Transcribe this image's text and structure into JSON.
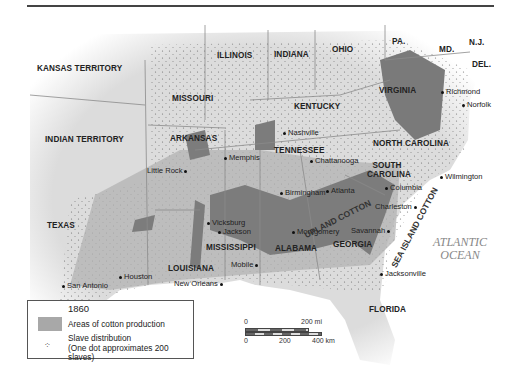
{
  "map": {
    "title_year": "1860",
    "colors": {
      "background": "#ffffff",
      "land": "#e4e4e4",
      "cotton": "#a9a9a9",
      "cotton_dense": "#7d7d7d",
      "ocean": "#ffffff",
      "border": "#8a8a8a"
    },
    "states": [
      {
        "name": "KANSAS TERRITORY"
      },
      {
        "name": "MISSOURI"
      },
      {
        "name": "ILLINOIS"
      },
      {
        "name": "INDIANA"
      },
      {
        "name": "OHIO"
      },
      {
        "name": "PA."
      },
      {
        "name": "MD."
      },
      {
        "name": "N.J."
      },
      {
        "name": "DEL."
      },
      {
        "name": "VIRGINIA"
      },
      {
        "name": "KENTUCKY"
      },
      {
        "name": "INDIAN TERRITORY"
      },
      {
        "name": "ARKANSAS"
      },
      {
        "name": "TENNESSEE"
      },
      {
        "name": "NORTH CAROLINA"
      },
      {
        "name": "SOUTH CAROLINA"
      },
      {
        "name": "TEXAS"
      },
      {
        "name": "MISSISSIPPI"
      },
      {
        "name": "ALABAMA"
      },
      {
        "name": "GEORGIA"
      },
      {
        "name": "LOUISIANA"
      },
      {
        "name": "FLORIDA"
      }
    ],
    "cities": [
      {
        "name": "Richmond"
      },
      {
        "name": "Norfolk"
      },
      {
        "name": "Nashville"
      },
      {
        "name": "Memphis"
      },
      {
        "name": "Chattanooga"
      },
      {
        "name": "Little Rock"
      },
      {
        "name": "Wilmington"
      },
      {
        "name": "Birmingham"
      },
      {
        "name": "Atlanta"
      },
      {
        "name": "Columbia"
      },
      {
        "name": "Charleston"
      },
      {
        "name": "Vicksburg"
      },
      {
        "name": "Jackson"
      },
      {
        "name": "Montgomery"
      },
      {
        "name": "Savannah"
      },
      {
        "name": "Mobile"
      },
      {
        "name": "Houston"
      },
      {
        "name": "San Antonio"
      },
      {
        "name": "New Orleans"
      },
      {
        "name": "Jacksonville"
      }
    ],
    "regions": {
      "upland": "UPLAND COTTON",
      "sea_island": "SEA ISLAND COTTON"
    },
    "ocean": {
      "line1": "ATLANTIC",
      "line2": "OCEAN"
    }
  },
  "legend": {
    "year": "1860",
    "cotton_label": "Areas of cotton production",
    "slave_label_1": "Slave distribution",
    "slave_label_2": "(One dot approximates 200 slaves)",
    "dot_glyph": "⁘"
  },
  "scale": {
    "mi_0": "0",
    "mi_200": "200 mi",
    "km_0": "0",
    "km_200": "200",
    "km_400": "400 km"
  }
}
